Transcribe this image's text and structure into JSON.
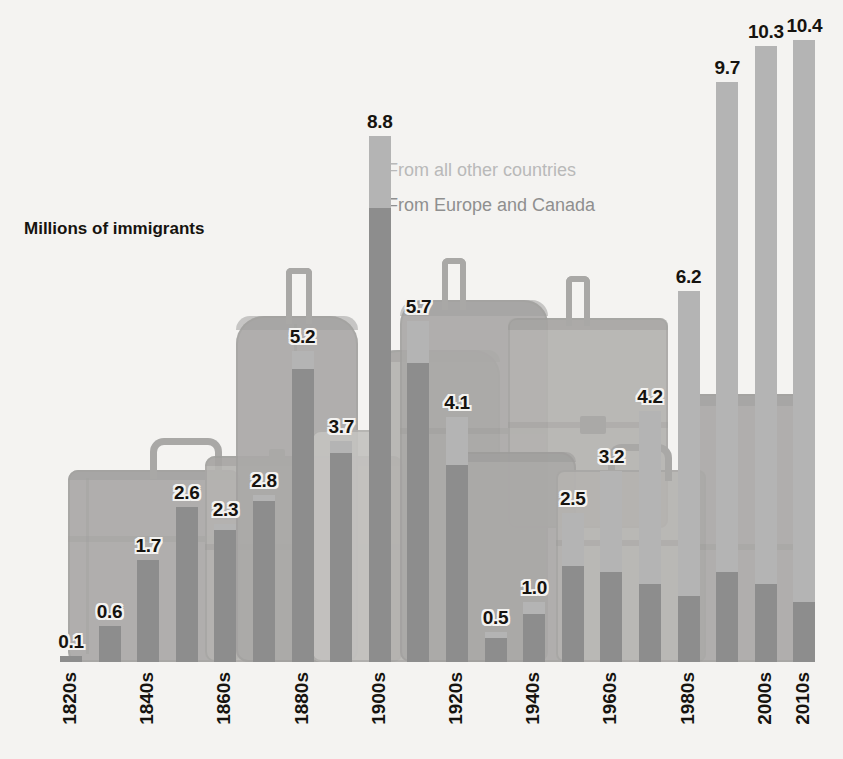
{
  "chart_data": {
    "type": "bar",
    "subtype": "stacked-bar",
    "title": "",
    "axis_title": "Millions of immigrants",
    "xlabel": "",
    "ylabel": "Millions of immigrants",
    "ylim": [
      0,
      10.8
    ],
    "grid": false,
    "legend_position": "inside-upper-center",
    "categories": [
      "1820s",
      "1830s",
      "1840s",
      "1850s",
      "1860s",
      "1870s",
      "1880s",
      "1890s",
      "1900s",
      "1910s",
      "1920s",
      "1930s",
      "1940s",
      "1950s",
      "1960s",
      "1970s",
      "1980s",
      "1990s",
      "2000s",
      "2010s"
    ],
    "tick_labels": [
      "1820s",
      "1840s",
      "1860s",
      "1880s",
      "1900s",
      "1920s",
      "1940s",
      "1960s",
      "1980s",
      "2000s",
      "2010s"
    ],
    "totals": [
      0.1,
      0.6,
      1.7,
      2.6,
      2.3,
      2.8,
      5.2,
      3.7,
      8.8,
      5.7,
      4.1,
      0.5,
      1.0,
      2.5,
      3.2,
      4.2,
      6.2,
      9.7,
      10.3,
      10.4
    ],
    "data_labels": [
      "0.1",
      "0.6",
      "1.7",
      "2.6",
      "2.3",
      "2.8",
      "5.2",
      "3.7",
      "8.8",
      "5.7",
      "4.1",
      "0.5",
      "1.0",
      "2.5",
      "3.2",
      "4.2",
      "6.2",
      "9.7",
      "10.3",
      "10.4"
    ],
    "series": [
      {
        "name": "From Europe and Canada",
        "color": "#8d8d8d",
        "values": [
          0.1,
          0.6,
          1.7,
          2.6,
          2.2,
          2.7,
          4.9,
          3.5,
          7.6,
          5.0,
          3.3,
          0.4,
          0.8,
          1.6,
          1.5,
          1.3,
          1.1,
          1.5,
          1.3,
          1.0
        ]
      },
      {
        "name": "From all other countries",
        "color": "#b4b4b4",
        "values": [
          0.0,
          0.0,
          0.0,
          0.0,
          0.1,
          0.1,
          0.3,
          0.2,
          1.2,
          0.7,
          0.8,
          0.1,
          0.2,
          0.9,
          1.7,
          2.9,
          5.1,
          8.2,
          9.0,
          9.4
        ]
      }
    ]
  },
  "legend": {
    "other_label": "From all other countries",
    "europe_label": "From Europe and Canada"
  },
  "colors": {
    "other": "#b4b4b4",
    "europe": "#8d8d8d",
    "text": "#16130f",
    "background": "#f4f3f1"
  }
}
